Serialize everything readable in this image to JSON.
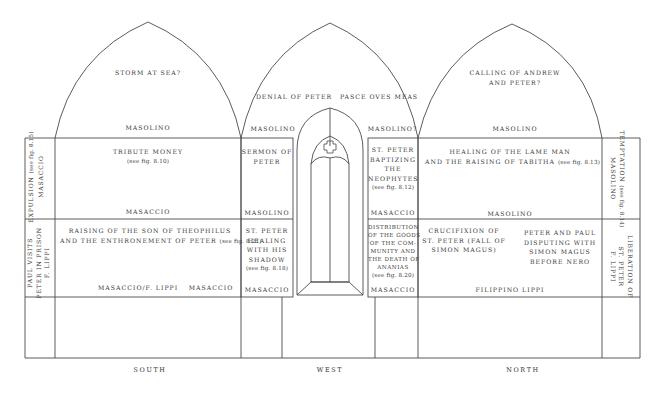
{
  "walls": {
    "south": "SOUTH",
    "west": "WEST",
    "north": "NORTH"
  },
  "lunettes": {
    "south": {
      "scene": "STORM AT SEA?",
      "artist": "MASOLINO"
    },
    "west_left": {
      "scene": "DENIAL OF PETER",
      "artist": "MASOLINO"
    },
    "west_right": {
      "scene": "PASCE OVES MEAS",
      "artist": "MASOLINO?"
    },
    "north": {
      "scene_line1": "CALLING OF ANDREW",
      "scene_line2": "AND PETER?",
      "artist": "MASOLINO"
    }
  },
  "upper_register": {
    "south_pilaster": {
      "scene": "EXPULSION",
      "ref": "(see fig. 8.15)",
      "artist": "MASACCIO"
    },
    "south_main": {
      "scene": "TRIBUTE MONEY",
      "ref": "(see fig. 8.10)",
      "artist": "MASACCIO"
    },
    "west_left": {
      "scene_line1": "SERMON OF",
      "scene_line2": "PETER",
      "artist": "MASOLINO"
    },
    "west_right": {
      "scene_lines": [
        "ST. PETER",
        "BAPTIZING",
        "THE",
        "NEOPHYTES"
      ],
      "ref": "(see fig. 8.12)",
      "artist": "MASACCIO"
    },
    "north_main": {
      "scene_line1": "HEALING OF THE LAME MAN",
      "scene_line2": "AND THE RAISING OF TABITHA",
      "ref": "(see fig. 8.13)",
      "artist": "MASOLINO"
    },
    "north_pilaster": {
      "scene": "TEMPTATION",
      "ref": "(see fig. 8.14)",
      "artist": "MASOLINO"
    }
  },
  "lower_register": {
    "south_pilaster": {
      "scene_line1": "PAUL VISITS",
      "scene_line2": "PETER IN PRISON",
      "artist": "F. LIPPI"
    },
    "south_main": {
      "scene_line1": "RAISING OF THE SON OF THEOPHILUS",
      "scene_line2": "AND THE ENTHRONEMENT OF PETER",
      "ref": "(see fig. 8.21)",
      "artist_left": "MASACCIO/F. LIPPI",
      "artist_right": "MASACCIO"
    },
    "west_left": {
      "scene_lines": [
        "ST. PETER",
        "HEALING",
        "WITH HIS",
        "SHADOW"
      ],
      "ref": "(see fig. 8.18)",
      "artist": "MASACCIO"
    },
    "west_right": {
      "scene_lines": [
        "DISTRIBUTION",
        "OF THE GOODS",
        "OF THE COM-",
        "MUNITY AND",
        "THE DEATH OF",
        "ANANIAS"
      ],
      "ref": "(see fig. 8.20)",
      "artist": "MASACCIO"
    },
    "north_left": {
      "scene_lines": [
        "CRUCIFIXION OF",
        "ST. PETER (FALL OF",
        "SIMON MAGUS)"
      ]
    },
    "north_right": {
      "scene_lines": [
        "PETER AND PAUL",
        "DISPUTING WITH",
        "SIMON MAGUS",
        "BEFORE NERO"
      ]
    },
    "north_artist": "FILIPPINO LIPPI",
    "north_pilaster": {
      "scene_line1": "LIBERATION OF",
      "scene_line2": "ST. PETER",
      "artist": "F. LIPPI"
    }
  },
  "colors": {
    "line": "#4a4a4a",
    "text": "#3a3a3a",
    "background": "#ffffff"
  }
}
